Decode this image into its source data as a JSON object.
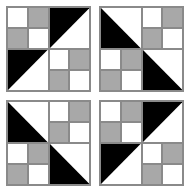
{
  "canvas": {
    "width": 190,
    "height": 193,
    "background": "#ffffff",
    "description": "Four quilt blocks arranged in a two-by-two grid"
  },
  "palette": {
    "white": "#ffffff",
    "gray": "#a8a8a8",
    "black": "#000000",
    "grid_line": "#8a8a8a"
  },
  "legend": {
    "white_label": "white",
    "gray_label": "gray",
    "black_label": "black"
  },
  "blocks": [
    {
      "id": "block-top-left",
      "name": "Block A",
      "position": "top-left",
      "quadrants": [
        {
          "id": "q-tl",
          "position": "top-left",
          "type": "four-patch",
          "patches": [
            "white",
            "gray",
            "gray",
            "white"
          ]
        },
        {
          "id": "q-tr",
          "position": "top-right",
          "type": "triangle",
          "black_corner": "upper-left",
          "white_corner": "lower-right"
        },
        {
          "id": "q-bl",
          "position": "bottom-left",
          "type": "triangle",
          "black_corner": "upper-left",
          "white_corner": "lower-right"
        },
        {
          "id": "q-br",
          "position": "bottom-right",
          "type": "four-patch",
          "patches": [
            "white",
            "gray",
            "gray",
            "white"
          ]
        }
      ]
    },
    {
      "id": "block-top-right",
      "name": "Block B",
      "position": "top-right",
      "quadrants": [
        {
          "id": "q-tl",
          "position": "top-left",
          "type": "triangle",
          "black_corner": "lower-left",
          "white_corner": "upper-right"
        },
        {
          "id": "q-tr",
          "position": "top-right",
          "type": "four-patch",
          "patches": [
            "white",
            "gray",
            "gray",
            "white"
          ]
        },
        {
          "id": "q-bl",
          "position": "bottom-left",
          "type": "four-patch",
          "patches": [
            "white",
            "gray",
            "gray",
            "white"
          ]
        },
        {
          "id": "q-br",
          "position": "bottom-right",
          "type": "triangle",
          "black_corner": "lower-left",
          "white_corner": "upper-right"
        }
      ]
    },
    {
      "id": "block-bottom-left",
      "name": "Block B",
      "position": "bottom-left",
      "quadrants": [
        {
          "id": "q-tl",
          "position": "top-left",
          "type": "triangle",
          "black_corner": "lower-left",
          "white_corner": "upper-right"
        },
        {
          "id": "q-tr",
          "position": "top-right",
          "type": "four-patch",
          "patches": [
            "white",
            "gray",
            "gray",
            "white"
          ]
        },
        {
          "id": "q-bl",
          "position": "bottom-left",
          "type": "four-patch",
          "patches": [
            "white",
            "gray",
            "gray",
            "white"
          ]
        },
        {
          "id": "q-br",
          "position": "bottom-right",
          "type": "triangle",
          "black_corner": "lower-left",
          "white_corner": "upper-right"
        }
      ]
    },
    {
      "id": "block-bottom-right",
      "name": "Block A",
      "position": "bottom-right",
      "quadrants": [
        {
          "id": "q-tl",
          "position": "top-left",
          "type": "four-patch",
          "patches": [
            "white",
            "gray",
            "gray",
            "white"
          ]
        },
        {
          "id": "q-tr",
          "position": "top-right",
          "type": "triangle",
          "black_corner": "upper-left",
          "white_corner": "lower-right"
        },
        {
          "id": "q-bl",
          "position": "bottom-left",
          "type": "triangle",
          "black_corner": "upper-left",
          "white_corner": "lower-right"
        },
        {
          "id": "q-br",
          "position": "bottom-right",
          "type": "four-patch",
          "patches": [
            "white",
            "gray",
            "gray",
            "white"
          ]
        }
      ]
    }
  ]
}
